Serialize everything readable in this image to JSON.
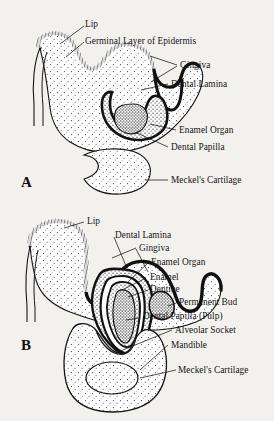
{
  "figure": {
    "background_color": "#f2f1ee",
    "ink_color": "#141414",
    "panels": [
      {
        "letter": "A",
        "name": "panel-a-early-bud-stage",
        "labels": [
          {
            "id": "lip",
            "text": "Lip"
          },
          {
            "id": "germinal",
            "text": "Germinal Layer of Epidermis"
          },
          {
            "id": "gingiva",
            "text": "Gingiva"
          },
          {
            "id": "lamina",
            "text": "Dental Lamina"
          },
          {
            "id": "enamelorgan",
            "text": "Enamel Organ"
          },
          {
            "id": "papilla",
            "text": "Dental Papilla"
          },
          {
            "id": "meckel",
            "text": "Meckel's Cartilage"
          }
        ]
      },
      {
        "letter": "B",
        "name": "panel-b-bell-stage",
        "labels": [
          {
            "id": "lip",
            "text": "Lip"
          },
          {
            "id": "lamina",
            "text": "Dental Lamina"
          },
          {
            "id": "gingiva",
            "text": "Gingiva"
          },
          {
            "id": "enamelorg",
            "text": "Enamel Organ"
          },
          {
            "id": "enamel",
            "text": "Enamel"
          },
          {
            "id": "dentine",
            "text": "Dentine"
          },
          {
            "id": "permbud",
            "text": "Permanent Bud"
          },
          {
            "id": "pulp",
            "text": "Dental Papilla (Pulp)"
          },
          {
            "id": "socket",
            "text": "Alveolar Socket"
          },
          {
            "id": "mandible",
            "text": "Mandible"
          },
          {
            "id": "meckel",
            "text": "Meckel's Cartilage"
          }
        ]
      }
    ]
  }
}
